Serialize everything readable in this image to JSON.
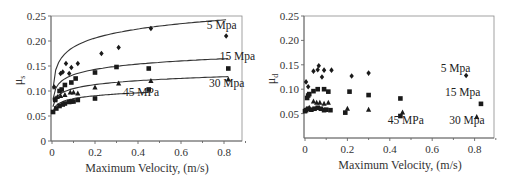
{
  "chart_data": [
    {
      "type": "scatter",
      "title": "",
      "xlabel": "Maximum Velocity, (m/s)",
      "ylabel": "μs",
      "xlim": [
        0,
        0.9
      ],
      "ylim": [
        0,
        0.25
      ],
      "xticks": [
        "0",
        "0.2",
        "0.4",
        "0.6",
        "0.8"
      ],
      "yticks": [
        "0",
        "0.05",
        "0.10",
        "0.15",
        "0.20",
        "0.25"
      ],
      "grid": false,
      "legend": "inline annotations",
      "series": [
        {
          "name": "5 Mpa",
          "marker": "diamond",
          "points": [
            [
              0.01,
              0.108
            ],
            [
              0.04,
              0.135
            ],
            [
              0.05,
              0.138
            ],
            [
              0.065,
              0.155
            ],
            [
              0.08,
              0.135
            ],
            [
              0.09,
              0.147
            ],
            [
              0.12,
              0.155
            ],
            [
              0.23,
              0.175
            ],
            [
              0.31,
              0.187
            ],
            [
              0.46,
              0.225
            ],
            [
              0.81,
              0.21
            ]
          ],
          "fit": {
            "a": 0.248,
            "b": 0.067
          }
        },
        {
          "name": "15 Mpa",
          "marker": "square",
          "points": [
            [
              0.015,
              0.082
            ],
            [
              0.035,
              0.1
            ],
            [
              0.045,
              0.103
            ],
            [
              0.06,
              0.112
            ],
            [
              0.09,
              0.117
            ],
            [
              0.11,
              0.125
            ],
            [
              0.2,
              0.137
            ],
            [
              0.3,
              0.148
            ],
            [
              0.45,
              0.145
            ],
            [
              0.82,
              0.145
            ]
          ],
          "fit": {
            "a": 0.168,
            "b": 0.0395
          }
        },
        {
          "name": "30 Mpa",
          "marker": "triangle",
          "points": [
            [
              0.015,
              0.085
            ],
            [
              0.025,
              0.088
            ],
            [
              0.04,
              0.09
            ],
            [
              0.06,
              0.092
            ],
            [
              0.085,
              0.097
            ],
            [
              0.1,
              0.097
            ],
            [
              0.12,
              0.095
            ],
            [
              0.2,
              0.107
            ],
            [
              0.31,
              0.115
            ],
            [
              0.46,
              0.12
            ],
            [
              0.82,
              0.123
            ]
          ],
          "fit": {
            "a": 0.131,
            "b": 0.029
          }
        },
        {
          "name": "45 MPa",
          "marker": "square",
          "points": [
            [
              0.005,
              0.058
            ],
            [
              0.02,
              0.065
            ],
            [
              0.035,
              0.07
            ],
            [
              0.05,
              0.073
            ],
            [
              0.06,
              0.075
            ],
            [
              0.08,
              0.078
            ],
            [
              0.09,
              0.079
            ],
            [
              0.1,
              0.079
            ],
            [
              0.12,
              0.082
            ],
            [
              0.2,
              0.085
            ],
            [
              0.45,
              0.103
            ]
          ],
          "fit": {
            "a": 0.104,
            "b": 0.0215
          }
        }
      ],
      "annotations": [
        {
          "text": "5 Mpa",
          "x": 0.72,
          "y": 0.225
        },
        {
          "text": "15 Mpa",
          "x": 0.78,
          "y": 0.163
        },
        {
          "text": "30 Mpa",
          "x": 0.73,
          "y": 0.109
        },
        {
          "text": "45 MPa",
          "x": 0.33,
          "y": 0.09
        }
      ]
    },
    {
      "type": "scatter",
      "title": "",
      "xlabel": "Maximum Velocity, (m/s)",
      "ylabel": "μd",
      "xlim": [
        0,
        0.9
      ],
      "ylim": [
        0,
        0.25
      ],
      "xticks": [
        "0",
        "0.2",
        "0.4",
        "0.6",
        "0.8"
      ],
      "yticks": [
        "0.05",
        "0.10",
        "0.15",
        "0.20",
        "0.25"
      ],
      "grid": false,
      "legend": "inline annotations",
      "series": [
        {
          "name": "5 Mpa",
          "marker": "diamond",
          "points": [
            [
              0.005,
              0.115
            ],
            [
              0.015,
              0.105
            ],
            [
              0.04,
              0.137
            ],
            [
              0.06,
              0.14
            ],
            [
              0.065,
              0.148
            ],
            [
              0.08,
              0.125
            ],
            [
              0.09,
              0.139
            ],
            [
              0.125,
              0.139
            ],
            [
              0.22,
              0.127
            ],
            [
              0.3,
              0.133
            ],
            [
              0.76,
              0.128
            ]
          ]
        },
        {
          "name": "15 Mpa",
          "marker": "square",
          "points": [
            [
              0.01,
              0.082
            ],
            [
              0.015,
              0.087
            ],
            [
              0.02,
              0.09
            ],
            [
              0.04,
              0.096
            ],
            [
              0.06,
              0.1
            ],
            [
              0.09,
              0.1
            ],
            [
              0.11,
              0.095
            ],
            [
              0.21,
              0.095
            ],
            [
              0.3,
              0.088
            ],
            [
              0.45,
              0.081
            ],
            [
              0.83,
              0.07
            ]
          ]
        },
        {
          "name": "30 Mpa",
          "marker": "triangle",
          "points": [
            [
              0.005,
              0.058
            ],
            [
              0.02,
              0.062
            ],
            [
              0.04,
              0.075
            ],
            [
              0.055,
              0.072
            ],
            [
              0.07,
              0.072
            ],
            [
              0.09,
              0.07
            ],
            [
              0.11,
              0.072
            ],
            [
              0.2,
              0.06
            ],
            [
              0.3,
              0.058
            ],
            [
              0.46,
              0.052
            ],
            [
              0.81,
              0.043
            ]
          ]
        },
        {
          "name": "45 MPa",
          "marker": "square",
          "points": [
            [
              0.0,
              0.055
            ],
            [
              0.005,
              0.057
            ],
            [
              0.015,
              0.06
            ],
            [
              0.03,
              0.058
            ],
            [
              0.045,
              0.06
            ],
            [
              0.06,
              0.062
            ],
            [
              0.075,
              0.06
            ],
            [
              0.09,
              0.057
            ],
            [
              0.1,
              0.058
            ],
            [
              0.12,
              0.057
            ],
            [
              0.19,
              0.052
            ],
            [
              0.45,
              0.045
            ]
          ]
        }
      ],
      "annotations": [
        {
          "text": "5 Mpa",
          "x": 0.64,
          "y": 0.135
        },
        {
          "text": "15 Mpa",
          "x": 0.66,
          "y": 0.087
        },
        {
          "text": "30 Mpa",
          "x": 0.68,
          "y": 0.028
        },
        {
          "text": "45 MPa",
          "x": 0.39,
          "y": 0.028
        }
      ]
    }
  ]
}
